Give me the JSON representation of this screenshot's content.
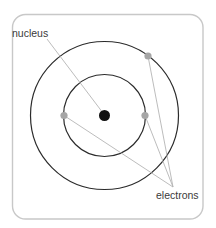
{
  "diagram": {
    "colors": {
      "background": "#ffffff",
      "frame": "#c8c8c8",
      "orbit": "#2b2b2b",
      "nucleus": "#111111",
      "electron": "#a6a6a6",
      "leader": "#b4b4b4",
      "label": "#3a3a3a"
    },
    "frame": {
      "x": 12.5,
      "y": 14.5,
      "width": 190.5,
      "height": 204.5,
      "radius": 13
    },
    "center": {
      "x": 104.5,
      "y": 115.5
    },
    "orbits": [
      {
        "name": "inner-orbit",
        "r": 41
      },
      {
        "name": "outer-orbit",
        "r": 74
      }
    ],
    "nucleus": {
      "r": 5.5
    },
    "electrons": [
      {
        "name": "electron-inner-left",
        "x": 64,
        "y": 115.5,
        "r": 3.6
      },
      {
        "name": "electron-inner-right",
        "x": 145,
        "y": 115.5,
        "r": 3.6
      },
      {
        "name": "electron-outer-top-right",
        "x": 148,
        "y": 56,
        "r": 3.6
      }
    ],
    "labels": {
      "nucleus": {
        "text": "nucleus",
        "x": 12,
        "y": 37
      },
      "electrons": {
        "text": "electrons",
        "x": 156,
        "y": 199
      }
    },
    "leaders": {
      "nucleus": {
        "x1": 47,
        "y1": 39,
        "x2": 103,
        "y2": 113
      },
      "electrons_target": {
        "x": 173,
        "y": 187
      }
    }
  }
}
